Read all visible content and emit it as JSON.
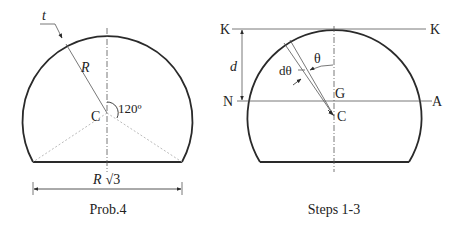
{
  "figures": [
    {
      "caption": "Prob.4",
      "labels": {
        "thickness": "t",
        "radius": "R",
        "center": "C",
        "angle": "120º",
        "width_R": "R",
        "width_sqrt": "√3"
      }
    },
    {
      "caption": "Steps 1-3",
      "labels": {
        "k_left": "K",
        "k_right": "K",
        "distance": "d",
        "n": "N",
        "a": "A",
        "g": "G",
        "center": "C",
        "theta": "θ",
        "dtheta": "dθ"
      }
    }
  ],
  "colors": {
    "stroke": "#2a2a2a",
    "thin": "#555555",
    "dotted": "#aaaaaa"
  }
}
